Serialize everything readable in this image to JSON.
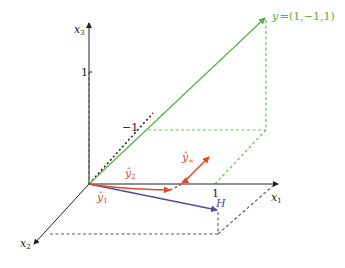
{
  "diagram": {
    "type": "3d-vector-projection",
    "axes": {
      "x1": {
        "label": "x",
        "sub": "1",
        "tick": "1"
      },
      "x2": {
        "label": "x",
        "sub": "2"
      },
      "x3": {
        "label": "x",
        "sub": "3",
        "tick": "1"
      },
      "neg_tick": "−1"
    },
    "vectors": {
      "y_prime": {
        "label": "y",
        "sup": "′",
        "coords": "=(1,−1,1)",
        "color": "#5aad4a"
      },
      "H": {
        "label": "H",
        "color": "#4a4f9a"
      },
      "y_hat_1": {
        "label": "ŷ",
        "sub": "1",
        "color": "#e04a2a"
      },
      "y_hat_2": {
        "label": "ŷ",
        "sub": "2",
        "color": "#e04a2a"
      },
      "y_hat_inf": {
        "label": "ŷ",
        "sub": "∞",
        "color": "#e04a2a"
      }
    },
    "colors": {
      "axis": "#222222",
      "green": "#5aad4a",
      "green_dash": "#6fbf5e",
      "blue": "#4a4f9a",
      "red": "#e04a2a",
      "gray_dash": "#555577"
    }
  }
}
